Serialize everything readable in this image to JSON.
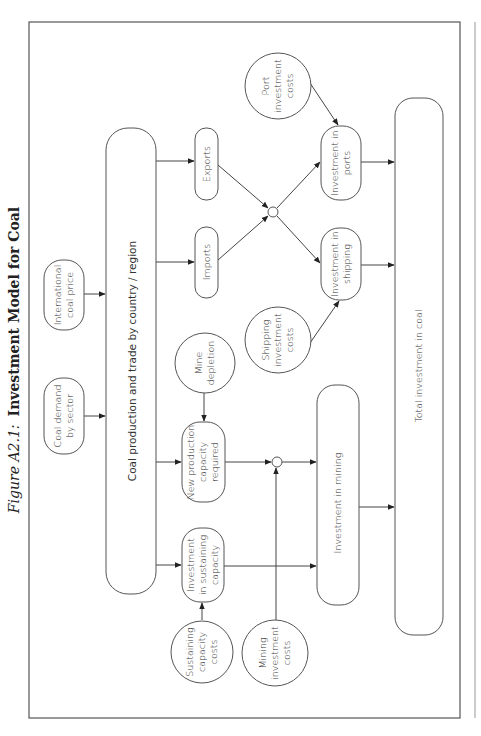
{
  "figure": {
    "label": "Figure A2.1:",
    "title": "Investment Model for Coal"
  },
  "nodes": {
    "coal_demand": [
      "Coal demand",
      "by sector"
    ],
    "intl_price": [
      "International",
      "coal price"
    ],
    "production_trade": "Coal production and trade by country / region",
    "exports": "Exports",
    "imports": "Imports",
    "port_costs": [
      "Port",
      "investment",
      "costs"
    ],
    "shipping_costs": [
      "Shipping",
      "investment",
      "costs"
    ],
    "invest_ports": [
      "Investment in",
      "ports"
    ],
    "invest_shipping": [
      "Investment in",
      "shipping"
    ],
    "mine_depletion": [
      "Mine",
      "depletion"
    ],
    "new_capacity": [
      "New production",
      "capacity",
      "required"
    ],
    "sustaining_invest": [
      "Investment",
      "in sustaining",
      "capacity"
    ],
    "sustaining_costs": [
      "Sustaining",
      "capacity",
      "costs"
    ],
    "mining_costs": [
      "Mining",
      "investment",
      "costs"
    ],
    "invest_mining": "Investment in mining",
    "total_invest": "Total investment in coal"
  },
  "colors": {
    "stroke": "#555555",
    "text": "#333333",
    "background": "#ffffff"
  }
}
